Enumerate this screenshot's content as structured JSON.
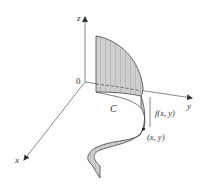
{
  "figure": {
    "axes": {
      "z_label": "z",
      "y_label": "y",
      "x_label": "x",
      "origin_label": "0"
    },
    "curve_label": "C",
    "height_label": "f(x, y)",
    "point_label": "(x, y)",
    "colors": {
      "axis": "#555555",
      "surface_fill": "#c8c8c8",
      "surface_edge": "#444444",
      "hatch": "#8a8a8a",
      "text": "#333333",
      "background": "#ffffff"
    }
  }
}
